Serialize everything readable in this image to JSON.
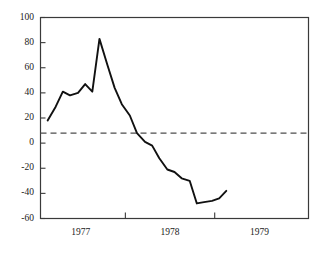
{
  "chart_data": {
    "type": "line",
    "title": "",
    "xlabel": "",
    "ylabel": "",
    "xlim": [
      1976.55,
      1979.55
    ],
    "ylim": [
      -60,
      100
    ],
    "grid": false,
    "legend": null,
    "y_ticks": [
      100,
      80,
      60,
      40,
      20,
      0,
      -20,
      -40,
      -60
    ],
    "y_tick_labels": [
      "100",
      "80",
      "60",
      "40",
      "20",
      "0",
      "-20",
      "-40",
      "-60"
    ],
    "x_ticks": [
      1977.5,
      1978.5
    ],
    "x_tick_labels": [
      "",
      ""
    ],
    "x_category_labels": [
      "1977",
      "1978",
      "1979"
    ],
    "x_category_centers": [
      1977.0,
      1978.0,
      1979.0
    ],
    "reference_line": {
      "style": "dashed",
      "value": 8,
      "color": "#4d4d4d"
    },
    "series": [
      {
        "name": "series-1",
        "color": "#111111",
        "x": [
          1976.63,
          1976.72,
          1976.8,
          1976.88,
          1976.97,
          1977.05,
          1977.13,
          1977.21,
          1977.3,
          1977.38,
          1977.46,
          1977.55,
          1977.63,
          1977.72,
          1977.8,
          1977.88,
          1977.97,
          1978.05,
          1978.13,
          1978.22,
          1978.3,
          1978.38,
          1978.47,
          1978.55,
          1978.63
        ],
        "y": [
          18,
          29,
          41,
          38,
          40,
          47,
          41,
          83,
          62,
          44,
          31,
          22,
          8,
          1,
          -2,
          -12,
          -21,
          -23,
          -28,
          -30,
          -48,
          -47,
          -46,
          -44,
          -38
        ]
      }
    ]
  }
}
